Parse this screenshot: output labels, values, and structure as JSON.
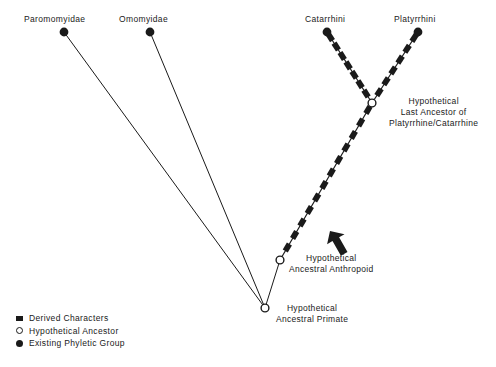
{
  "figure": {
    "type": "cladogram",
    "background": "#ffffff",
    "ink_color": "#1a1a1a"
  },
  "tips": [
    {
      "id": "paromomyidae",
      "label": "Paromomyidae",
      "marker": "existing-phyletic-group",
      "label_x": 24,
      "label_y": 14,
      "dot_x": 64,
      "dot_y": 32
    },
    {
      "id": "omomyidae",
      "label": "Omomyidae",
      "marker": "existing-phyletic-group",
      "label_x": 119,
      "label_y": 14,
      "dot_x": 150,
      "dot_y": 32
    },
    {
      "id": "catarrhini",
      "label": "Catarrhini",
      "marker": "existing-phyletic-group",
      "label_x": 305,
      "label_y": 14,
      "dot_x": 327,
      "dot_y": 32
    },
    {
      "id": "platyrrhini",
      "label": "Platyrrhini",
      "marker": "existing-phyletic-group",
      "label_x": 394,
      "label_y": 14,
      "dot_x": 418,
      "dot_y": 32
    }
  ],
  "internal_nodes": [
    {
      "id": "last-ancestor-platyrrhine-catarrhine",
      "marker": "hypothetical-ancestor",
      "x": 372,
      "y": 103,
      "label_lines": [
        "Hypothetical",
        "Last Ancestor of",
        "Platyrrhine/Catarrhine"
      ],
      "label_x": 389,
      "label_y": 96
    },
    {
      "id": "ancestral-anthropoid",
      "marker": "hypothetical-ancestor",
      "x": 280,
      "y": 260,
      "label_lines": [
        "Hypothetical",
        "Ancestral Anthropoid"
      ],
      "label_x": 289,
      "label_y": 253
    },
    {
      "id": "ancestral-primate",
      "marker": "hypothetical-ancestor",
      "x": 265,
      "y": 308,
      "label_lines": [
        "Hypothetical",
        "Ancestral Primate"
      ],
      "label_x": 276,
      "label_y": 303
    }
  ],
  "branches": [
    {
      "id": "root-to-paromomyidae",
      "from": [
        265,
        308
      ],
      "to": [
        64,
        32
      ],
      "style": "plain",
      "derived_characters": 0
    },
    {
      "id": "root-to-omomyidae",
      "from": [
        265,
        308
      ],
      "to": [
        150,
        32
      ],
      "style": "plain",
      "derived_characters": 0
    },
    {
      "id": "root-to-anthropoid",
      "from": [
        265,
        308
      ],
      "to": [
        280,
        260
      ],
      "style": "plain",
      "derived_characters": 0
    },
    {
      "id": "anthropoid-to-fork",
      "from": [
        280,
        260
      ],
      "to": [
        372,
        103
      ],
      "style": "derived-characters",
      "derived_characters": 12
    },
    {
      "id": "fork-to-catarrhini",
      "from": [
        372,
        103
      ],
      "to": [
        327,
        32
      ],
      "style": "derived-characters",
      "derived_characters": 7
    },
    {
      "id": "fork-to-platyrrhini",
      "from": [
        372,
        103
      ],
      "to": [
        418,
        32
      ],
      "style": "derived-characters",
      "derived_characters": 6
    }
  ],
  "annotation_arrow": {
    "id": "anthropoid-pointer",
    "points_to": "ancestral-anthropoid",
    "direction": "up-left",
    "x": 330,
    "y": 231
  },
  "legend": {
    "items": [
      {
        "marker": "derived-characters",
        "label": "Derived  Characters"
      },
      {
        "marker": "hypothetical-ancestor",
        "label": "Hypothetical  Ancestor"
      },
      {
        "marker": "existing-phyletic-group",
        "label": "Existing  Phyletic  Group"
      }
    ]
  }
}
